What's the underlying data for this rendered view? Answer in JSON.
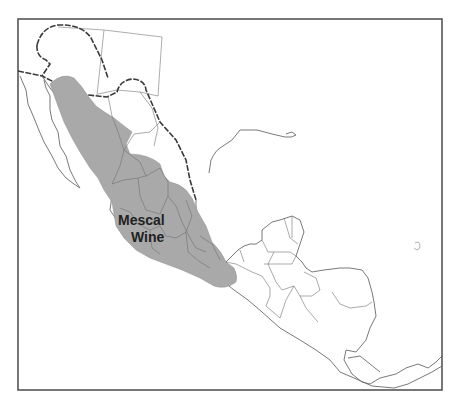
{
  "map": {
    "regions": [
      {
        "name": "Mescal Wine",
        "label_lines": [
          "Mescal",
          "Wine"
        ],
        "fill": "#a9a9a9"
      }
    ],
    "colors": {
      "background": "#ffffff",
      "land_outline": "#6a6a6a",
      "region_fill": "#a9a9a9",
      "label": "#222222"
    }
  }
}
